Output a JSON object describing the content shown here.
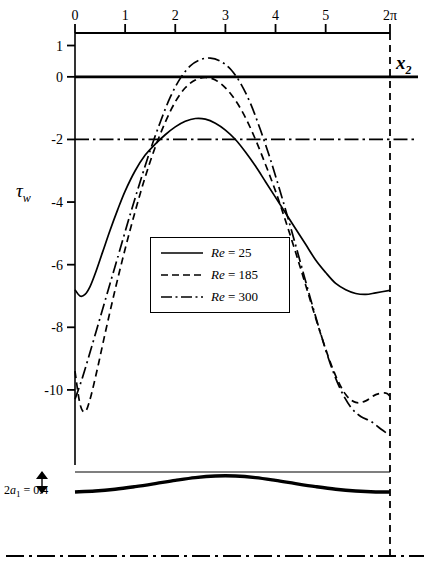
{
  "chart_data": {
    "type": "line",
    "title": "",
    "xlabel": "x_2",
    "ylabel": "tau_w",
    "xlim": [
      0,
      6.283185
    ],
    "ylim": [
      -11.6,
      1.4
    ],
    "xticks": [
      0,
      1,
      2,
      3,
      4,
      5,
      6.283185
    ],
    "xticklabels": [
      "0",
      "1",
      "2",
      "3",
      "4",
      "5",
      "2π"
    ],
    "yticks": [
      1,
      0,
      -2,
      -4,
      -6,
      -8,
      -10
    ],
    "yticklabels": [
      "1",
      "0",
      "-2",
      "-4",
      "-6",
      "-8",
      "-10"
    ],
    "grid": false,
    "legend_position": "center",
    "reference_lines": [
      {
        "name": "zero-line",
        "y": 0,
        "style": "solid"
      },
      {
        "name": "minus-two-line",
        "y": -2,
        "style": "dashdot"
      },
      {
        "name": "two-pi-line",
        "x": 6.283185,
        "style": "dashed"
      }
    ],
    "series": [
      {
        "name": "Re = 25",
        "style": "solid",
        "x": [
          0.0,
          0.1,
          0.2,
          0.3,
          0.4,
          0.55,
          0.7,
          0.85,
          1.0,
          1.2,
          1.4,
          1.6,
          1.8,
          2.0,
          2.2,
          2.4,
          2.6,
          2.8,
          3.0,
          3.2,
          3.4,
          3.6,
          3.8,
          4.0,
          4.2,
          4.4,
          4.6,
          4.8,
          5.0,
          5.2,
          5.4,
          5.6,
          5.8,
          6.0,
          6.28
        ],
        "y": [
          -6.8,
          -7.0,
          -6.95,
          -6.7,
          -6.3,
          -5.6,
          -4.9,
          -4.25,
          -3.65,
          -3.0,
          -2.5,
          -2.15,
          -1.85,
          -1.6,
          -1.42,
          -1.33,
          -1.35,
          -1.48,
          -1.7,
          -2.0,
          -2.4,
          -2.85,
          -3.35,
          -3.85,
          -4.35,
          -4.85,
          -5.35,
          -5.85,
          -6.25,
          -6.6,
          -6.8,
          -6.92,
          -6.95,
          -6.9,
          -6.82
        ]
      },
      {
        "name": "Re = 185",
        "style": "dashed",
        "x": [
          0.0,
          0.1,
          0.2,
          0.3,
          0.45,
          0.6,
          0.8,
          1.0,
          1.2,
          1.4,
          1.6,
          1.8,
          2.0,
          2.2,
          2.4,
          2.6,
          2.8,
          3.0,
          3.2,
          3.4,
          3.6,
          3.8,
          4.0,
          4.2,
          4.4,
          4.6,
          4.8,
          5.0,
          5.2,
          5.4,
          5.6,
          5.8,
          6.0,
          6.2,
          6.28
        ],
        "y": [
          -9.4,
          -10.45,
          -10.7,
          -10.3,
          -9.3,
          -8.2,
          -6.8,
          -5.5,
          -4.3,
          -3.2,
          -2.25,
          -1.45,
          -0.8,
          -0.35,
          -0.1,
          -0.02,
          -0.1,
          -0.35,
          -0.75,
          -1.3,
          -2.0,
          -2.8,
          -3.65,
          -4.6,
          -5.6,
          -6.65,
          -7.7,
          -8.7,
          -9.55,
          -10.15,
          -10.4,
          -10.35,
          -10.15,
          -10.1,
          -10.2
        ]
      },
      {
        "name": "Re = 300",
        "style": "dashdot",
        "x": [
          0.0,
          0.15,
          0.3,
          0.5,
          0.7,
          0.9,
          1.1,
          1.3,
          1.5,
          1.7,
          1.9,
          2.1,
          2.3,
          2.5,
          2.7,
          2.9,
          3.1,
          3.3,
          3.5,
          3.7,
          3.9,
          4.1,
          4.3,
          4.5,
          4.7,
          4.9,
          5.1,
          5.3,
          5.5,
          5.7,
          5.9,
          6.1,
          6.28
        ],
        "y": [
          -10.3,
          -9.6,
          -8.8,
          -7.7,
          -6.6,
          -5.5,
          -4.4,
          -3.35,
          -2.35,
          -1.45,
          -0.65,
          -0.05,
          0.35,
          0.55,
          0.6,
          0.5,
          0.25,
          -0.2,
          -0.85,
          -1.7,
          -2.65,
          -3.7,
          -4.8,
          -5.95,
          -7.1,
          -8.2,
          -9.2,
          -10.0,
          -10.55,
          -10.85,
          -11.0,
          -11.25,
          -11.45
        ]
      }
    ],
    "legend": [
      {
        "label": "Re = 25",
        "style": "solid"
      },
      {
        "label": "Re = 185",
        "style": "dashed"
      },
      {
        "label": "Re = 300",
        "style": "dashdot"
      }
    ],
    "inset": {
      "name": "wavy-wall-profile",
      "annotation": "2a1 = 0.4",
      "annotation_html": "2<i>a</i><sub>1</sub> = 0.4",
      "x": [
        0.0,
        0.4,
        0.8,
        1.2,
        1.6,
        2.0,
        2.4,
        2.8,
        3.2,
        3.6,
        4.0,
        4.4,
        4.8,
        5.2,
        5.6,
        6.0,
        6.28
      ],
      "y": [
        0.0,
        0.05,
        0.14,
        0.27,
        0.42,
        0.58,
        0.72,
        0.8,
        0.8,
        0.72,
        0.58,
        0.42,
        0.27,
        0.14,
        0.05,
        0.0,
        0.0
      ]
    }
  },
  "labels": {
    "y_axis": "τ",
    "y_axis_sub": "w",
    "x_axis": "x",
    "x_axis_sub": "2",
    "amplitude_num": "2",
    "amplitude_a": "a",
    "amplitude_sub": "1",
    "amplitude_val": " = 0.4",
    "re_text": "Re",
    "re25_val": " = 25",
    "re185_val": " = 185",
    "re300_val": " = 300"
  },
  "colors": {
    "ink": "#000000",
    "background": "#ffffff"
  }
}
